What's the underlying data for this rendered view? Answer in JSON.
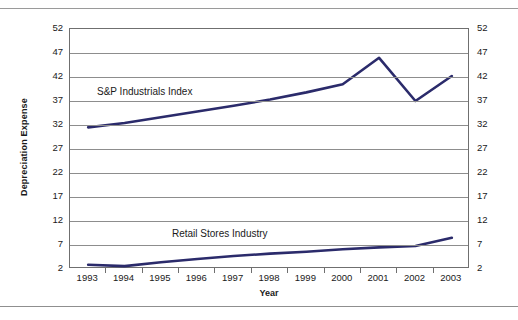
{
  "chart_data": {
    "type": "line",
    "title": "",
    "xlabel": "Year",
    "ylabel": "Depreciation Expense",
    "categories": [
      "1993",
      "1994",
      "1995",
      "1996",
      "1997",
      "1998",
      "1999",
      "2000",
      "2001",
      "2002",
      "2003"
    ],
    "ylim": [
      2,
      52
    ],
    "yticks": [
      52,
      47,
      42,
      37,
      32,
      27,
      22,
      17,
      12,
      7,
      2
    ],
    "yticks_right": [
      52,
      47,
      42,
      37,
      32,
      27,
      22,
      17,
      12,
      7,
      2
    ],
    "grid": true,
    "legend_position": "inline-annotation",
    "series": [
      {
        "name": "S&P Industrials Index",
        "color": "#2b2b6b",
        "values": [
          31.5,
          32.4,
          33.6,
          34.8,
          36.0,
          37.3,
          38.8,
          40.5,
          46.0,
          37.0,
          42.2
        ]
      },
      {
        "name": "Retail Stores Industry",
        "color": "#2b2b6b",
        "values": [
          2.9,
          2.6,
          3.4,
          4.1,
          4.7,
          5.2,
          5.6,
          6.1,
          6.5,
          6.8,
          8.5
        ]
      }
    ],
    "annotations": [
      {
        "text": "S&P Industrials Index",
        "series": "S&P Industrials Index"
      },
      {
        "text": "Retail Stores Industry",
        "series": "Retail Stores Industry"
      }
    ]
  },
  "axis": {
    "y_title": "Depreciation Expense",
    "x_title": "Year"
  },
  "colors": {
    "line": "#2b2b6b",
    "grid": "#8d8d8d",
    "frame": "#6f6f6f",
    "rule": "#9a9a9a",
    "text": "#1a1a1a"
  }
}
